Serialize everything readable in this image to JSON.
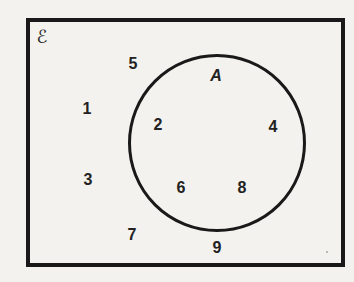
{
  "diagram": {
    "type": "set-diagram",
    "universal_set_label": "ℰ",
    "set_label": "A",
    "set_a_members": [
      "2",
      "4",
      "6",
      "8"
    ],
    "outside_members": [
      "5",
      "1",
      "3",
      "7",
      "9"
    ],
    "elements": [
      {
        "text": "5",
        "x": 133,
        "y": 64,
        "region": "outside"
      },
      {
        "text": "1",
        "x": 87,
        "y": 109,
        "region": "outside"
      },
      {
        "text": "2",
        "x": 158,
        "y": 125,
        "region": "inside"
      },
      {
        "text": "4",
        "x": 273,
        "y": 127,
        "region": "inside"
      },
      {
        "text": "3",
        "x": 88,
        "y": 180,
        "region": "outside"
      },
      {
        "text": "6",
        "x": 181,
        "y": 188,
        "region": "inside"
      },
      {
        "text": "8",
        "x": 242,
        "y": 188,
        "region": "inside"
      },
      {
        "text": "7",
        "x": 132,
        "y": 235,
        "region": "outside"
      },
      {
        "text": "9",
        "x": 217,
        "y": 248,
        "region": "outside"
      }
    ],
    "colors": {
      "paper": "#f3f2ee",
      "line": "#191919",
      "text": "#222222"
    }
  }
}
